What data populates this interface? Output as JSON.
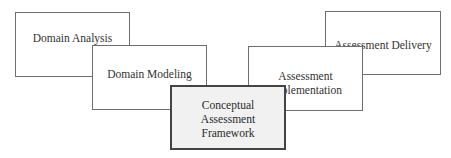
{
  "diagram": {
    "title": "",
    "stages": [
      {
        "id": "domain-analysis",
        "lines": [
          "Domain Analysis"
        ],
        "highlighted": false
      },
      {
        "id": "domain-modeling",
        "lines": [
          "Domain Modeling"
        ],
        "highlighted": false
      },
      {
        "id": "conceptual-assessment-framework",
        "lines": [
          "Conceptual",
          "Assessment",
          "Framework"
        ],
        "highlighted": true
      },
      {
        "id": "assessment-implementation",
        "lines": [
          "Assessment",
          "Implementation"
        ],
        "highlighted": false
      },
      {
        "id": "assessment-delivery",
        "lines": [
          "Assessment Delivery"
        ],
        "highlighted": false
      }
    ],
    "colors": {
      "box_fill": "#ffffff",
      "highlight_fill": "#f1f1f1",
      "border": "#6e6e6e",
      "highlight_border": "#444444",
      "text": "#333333"
    }
  }
}
